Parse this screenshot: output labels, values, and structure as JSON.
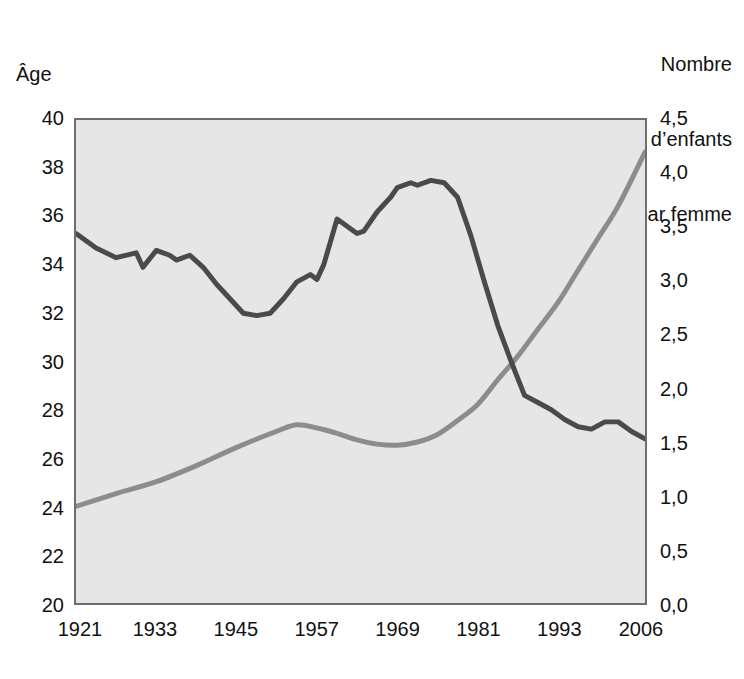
{
  "chart_data": {
    "type": "line",
    "title": "",
    "xlabel": "",
    "ylabel": "Âge",
    "y2label": "Nombre d’enfants par femme",
    "ylabel_right_lines": [
      "Nombre",
      "d’enfants",
      "par femme"
    ],
    "grid": false,
    "legend": "none",
    "xlim": [
      1921,
      2006
    ],
    "ylim": [
      20,
      40
    ],
    "y2lim": [
      0.0,
      4.5
    ],
    "xticks": [
      "1921",
      "1933",
      "1945",
      "1957",
      "1969",
      "1981",
      "1993",
      "2006"
    ],
    "xtick_values": [
      1921,
      1933,
      1945,
      1957,
      1969,
      1981,
      1993,
      2006
    ],
    "yticks": [
      "20",
      "22",
      "24",
      "26",
      "28",
      "30",
      "32",
      "34",
      "36",
      "38",
      "40"
    ],
    "ytick_values": [
      20,
      22,
      24,
      26,
      28,
      30,
      32,
      34,
      36,
      38,
      40
    ],
    "y2ticks": [
      "0,0",
      "0,5",
      "1,0",
      "1,5",
      "2,0",
      "2,5",
      "3,0",
      "3,5",
      "4,0",
      "4,5"
    ],
    "y2tick_values": [
      0.0,
      0.5,
      1.0,
      1.5,
      2.0,
      2.5,
      3.0,
      3.5,
      4.0,
      4.5
    ],
    "colors": {
      "age_line": "#4a4a4a",
      "fertility_line": "#8c8c8c",
      "plot_background": "#e6e6e6",
      "frame": "#6e6e6e"
    },
    "series": [
      {
        "name": "Âge",
        "axis": "left",
        "color": "#4a4a4a",
        "x": [
          1921,
          1924,
          1927,
          1930,
          1931,
          1933,
          1935,
          1936,
          1938,
          1940,
          1942,
          1944,
          1946,
          1948,
          1950,
          1952,
          1954,
          1956,
          1957,
          1958,
          1960,
          1962,
          1963,
          1964,
          1966,
          1968,
          1969,
          1971,
          1972,
          1974,
          1976,
          1978,
          1980,
          1982,
          1984,
          1986,
          1988,
          1990,
          1992,
          1994,
          1996,
          1998,
          2000,
          2002,
          2004,
          2006
        ],
        "values": [
          35.3,
          34.7,
          34.3,
          34.5,
          33.9,
          34.6,
          34.4,
          34.2,
          34.4,
          33.9,
          33.2,
          32.6,
          32.0,
          31.9,
          32.0,
          32.6,
          33.3,
          33.6,
          33.4,
          34.0,
          35.9,
          35.5,
          35.3,
          35.4,
          36.2,
          36.8,
          37.2,
          37.4,
          37.3,
          37.5,
          37.4,
          36.8,
          35.2,
          33.3,
          31.5,
          30.0,
          28.6,
          28.3,
          28.0,
          27.6,
          27.3,
          27.2,
          27.5,
          27.5,
          27.1,
          26.8
        ]
      },
      {
        "name": "Nombre d’enfants par femme",
        "axis": "right",
        "color": "#8c8c8c",
        "x": [
          1921,
          1927,
          1933,
          1939,
          1945,
          1951,
          1954,
          1957,
          1960,
          1963,
          1966,
          1969,
          1972,
          1975,
          1978,
          1981,
          1984,
          1987,
          1990,
          1993,
          1996,
          1999,
          2002,
          2006
        ],
        "values": [
          0.9,
          1.02,
          1.13,
          1.28,
          1.45,
          1.6,
          1.66,
          1.63,
          1.58,
          1.52,
          1.48,
          1.47,
          1.5,
          1.57,
          1.7,
          1.85,
          2.08,
          2.3,
          2.55,
          2.8,
          3.1,
          3.4,
          3.7,
          4.2
        ]
      }
    ]
  },
  "labels": {
    "left_axis_title": "Âge",
    "right_axis_title_line1": "Nombre",
    "right_axis_title_line2": "d’enfants",
    "right_axis_title_line3": "par femme"
  }
}
